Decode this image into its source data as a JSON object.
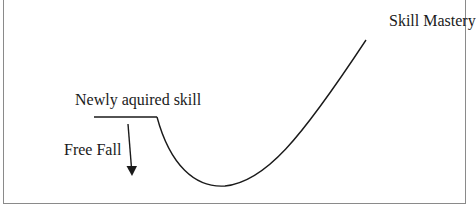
{
  "diagram": {
    "type": "learning-curve",
    "labels": {
      "mastery": "Skill Mastery",
      "newly_acquired": "Newly aquired skill",
      "free_fall": "Free Fall"
    },
    "colors": {
      "line": "#1a1a1a",
      "frame": "#8a8a8a",
      "background": "#ffffff"
    }
  }
}
